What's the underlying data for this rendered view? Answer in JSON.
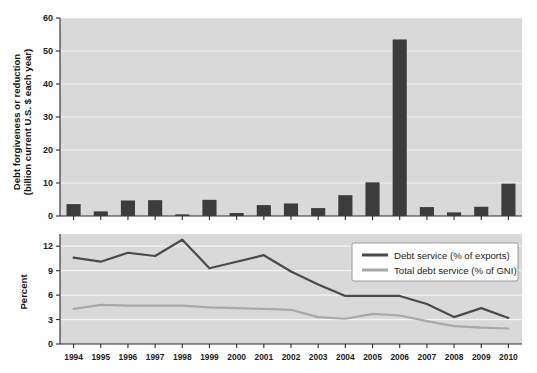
{
  "chart_data": [
    {
      "type": "bar",
      "panel": "top",
      "title": "",
      "xlabel": "",
      "ylabel": "Debt forgiveness or reduction\n(billion current U.S. $ each year)",
      "ylabel_line1": "Debt forgiveness or reduction",
      "ylabel_line2": "(billion current U.S. $ each year)",
      "categories": [
        "1994",
        "1995",
        "1996",
        "1997",
        "1998",
        "1999",
        "2000",
        "2001",
        "2002",
        "2003",
        "2004",
        "2005",
        "2006",
        "2007",
        "2008",
        "2009",
        "2010"
      ],
      "values": [
        3.6,
        1.4,
        4.7,
        4.8,
        0.5,
        4.9,
        0.9,
        3.3,
        3.8,
        2.4,
        6.3,
        10.2,
        53.5,
        2.7,
        1.1,
        2.8,
        9.8
      ],
      "ylim": [
        0,
        60
      ],
      "yticks": [
        0,
        10,
        20,
        30,
        40,
        50,
        60
      ],
      "ytick_labels": [
        "0",
        "10",
        "20",
        "30",
        "40",
        "50",
        "60"
      ],
      "grid": true,
      "bar_color": "#3c3c3c",
      "plot_background": "#d9d9d9"
    },
    {
      "type": "line",
      "panel": "bottom",
      "title": "",
      "xlabel": "",
      "ylabel": "Percent",
      "categories": [
        "1994",
        "1995",
        "1996",
        "1997",
        "1998",
        "1999",
        "2000",
        "2001",
        "2002",
        "2003",
        "2004",
        "2005",
        "2006",
        "2007",
        "2008",
        "2009",
        "2010"
      ],
      "series": [
        {
          "name": "Debt service (% of exports)",
          "color": "#4a4a4a",
          "values": [
            10.6,
            10.1,
            11.2,
            10.8,
            12.8,
            9.3,
            10.1,
            10.9,
            8.9,
            7.3,
            5.9,
            5.9,
            5.9,
            4.9,
            3.3,
            4.4,
            3.2
          ]
        },
        {
          "name": "Total debt service (% of GNI)",
          "color": "#a8a8a8",
          "values": [
            4.3,
            4.8,
            4.7,
            4.7,
            4.7,
            4.5,
            4.4,
            4.3,
            4.2,
            3.3,
            3.1,
            3.7,
            3.5,
            2.8,
            2.2,
            2.0,
            1.9
          ]
        }
      ],
      "ylim": [
        0,
        13.5
      ],
      "yticks": [
        0,
        3,
        6,
        9,
        12
      ],
      "ytick_labels": [
        "0",
        "3",
        "6",
        "9",
        "12"
      ],
      "grid": true,
      "legend_position": "top-right",
      "plot_background": "#d9d9d9"
    }
  ]
}
